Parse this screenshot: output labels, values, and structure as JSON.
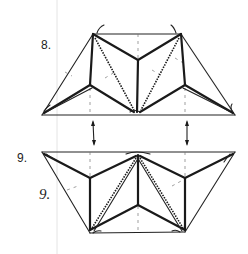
{
  "steps": [
    {
      "label": "8.",
      "type": "origami-fold-step"
    },
    {
      "label": "9.",
      "type": "origami-fold-step",
      "annotation": "9."
    }
  ],
  "arrows": [
    {
      "name": "left-flip-arrow",
      "direction": "up-down"
    },
    {
      "name": "right-flip-arrow",
      "direction": "up-down"
    }
  ],
  "colors": {
    "ink": "#1a1a1a",
    "guide": "#e4e4e4",
    "background": "#ffffff"
  }
}
